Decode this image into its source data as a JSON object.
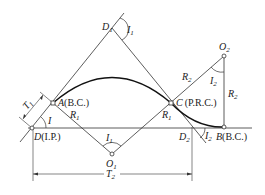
{
  "diagram": {
    "type": "reverse-compound curve geometry",
    "points": {
      "D": {
        "name": "D",
        "note": "(I.P.)",
        "x": 32,
        "y": 128
      },
      "A": {
        "name": "A",
        "note": "(B.C.)",
        "x": 53,
        "y": 103
      },
      "D1": {
        "name": "D",
        "sub": "1",
        "x": 112,
        "y": 28
      },
      "C": {
        "name": "C",
        "note": "(P.R.C.)",
        "x": 171,
        "y": 103
      },
      "O1": {
        "name": "O",
        "sub": "1",
        "x": 112,
        "y": 154
      },
      "O2": {
        "name": "O",
        "sub": "2",
        "x": 224,
        "y": 56
      },
      "B": {
        "name": "B",
        "note": "(B.C.)",
        "x": 224,
        "y": 127
      },
      "D2": {
        "name": "D",
        "sub": "2",
        "x": 192,
        "y": 127
      }
    },
    "labels": {
      "I": "I",
      "I1": {
        "main": "I",
        "sub": "1"
      },
      "I2": {
        "main": "I",
        "sub": "2"
      },
      "R1": {
        "main": "R",
        "sub": "1"
      },
      "R2": {
        "main": "R",
        "sub": "2"
      },
      "T1": {
        "main": "T",
        "sub": "1"
      },
      "T2": {
        "main": "T",
        "sub": "2"
      }
    },
    "colors": {
      "line": "#333333",
      "curve": "#111111",
      "background": "#ffffff"
    }
  }
}
